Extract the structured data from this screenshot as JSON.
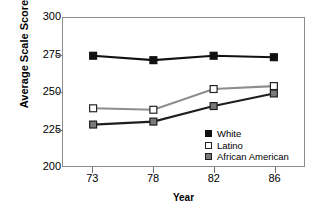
{
  "chart_data": {
    "type": "line",
    "title": "",
    "xlabel": "Year",
    "ylabel": "Average Scale Score",
    "categories": [
      "73",
      "78",
      "82",
      "86"
    ],
    "x_tick_labels": [
      "73",
      "78",
      "82",
      "86"
    ],
    "y_tick_labels": [
      "200",
      "225",
      "250",
      "275",
      "300"
    ],
    "y_ticks": [
      200,
      225,
      250,
      275,
      300
    ],
    "ylim": [
      200,
      300
    ],
    "grid": false,
    "legend_position": "inside-bottom-right",
    "series": [
      {
        "name": "White",
        "values": [
          274.5,
          271.5,
          274.5,
          273.5
        ],
        "line_color": "#111111",
        "marker": "filled-square",
        "marker_fill": "#111111",
        "marker_edge": "#111111"
      },
      {
        "name": "Latino",
        "values": [
          239,
          238,
          252,
          254
        ],
        "line_color": "#8d8d8d",
        "marker": "open-square",
        "marker_fill": "#ffffff",
        "marker_edge": "#222222"
      },
      {
        "name": "African American",
        "values": [
          228,
          230,
          240.5,
          249
        ],
        "line_color": "#1e1e1e",
        "marker": "gray-square",
        "marker_fill": "#7a7a7a",
        "marker_edge": "#1e1e1e"
      }
    ]
  },
  "axes": {
    "y_title": "Average Scale Score",
    "x_title": "Year",
    "y_labels": [
      "300",
      "275",
      "250",
      "225",
      "200"
    ],
    "x_labels": [
      "73",
      "78",
      "82",
      "86"
    ]
  },
  "legend": {
    "items": [
      {
        "label": "White"
      },
      {
        "label": "Latino"
      },
      {
        "label": "African American"
      }
    ]
  },
  "colors": {
    "frame": "#8c8c8c",
    "white_series": "#111111",
    "latino_series": "#8d8d8d",
    "african_american_series": "#1e1e1e",
    "african_american_marker": "#7a7a7a",
    "background": "#ffffff"
  }
}
